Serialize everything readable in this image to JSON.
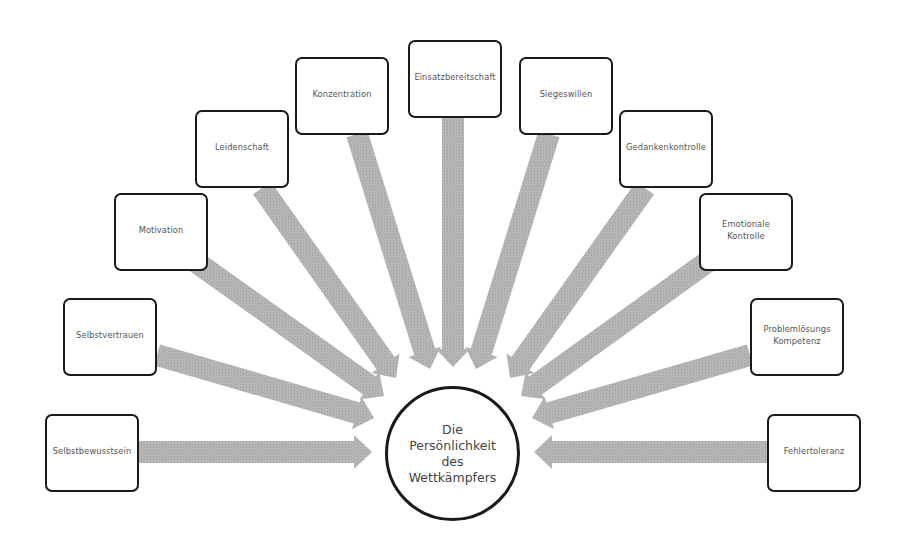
{
  "diagram": {
    "center": {
      "label": "Die\nPersönlichkeit\ndes\nWettkämpfers",
      "cx": 452,
      "cy": 453,
      "r": 67
    },
    "arrow_color": "#b3b3b3",
    "box_border_color": "#1a1a1a",
    "nodes": [
      {
        "id": "selbstbewusstsein",
        "label": "Selbstbewusstsein",
        "x": 45,
        "y": 414,
        "start": [
          138,
          452
        ],
        "end": [
          372,
          452
        ]
      },
      {
        "id": "selbstvertrauen",
        "label": "Selbstvertrauen",
        "x": 63,
        "y": 298,
        "start": [
          157,
          355
        ],
        "end": [
          374,
          418
        ]
      },
      {
        "id": "motivation",
        "label": "Motivation",
        "x": 114,
        "y": 193,
        "start": [
          196,
          262
        ],
        "end": [
          384,
          396
        ]
      },
      {
        "id": "leidenschaft",
        "label": "Leidenschaft",
        "x": 195,
        "y": 110,
        "start": [
          262,
          188
        ],
        "end": [
          396,
          378
        ]
      },
      {
        "id": "konzentration",
        "label": "Konzentration",
        "x": 295,
        "y": 57,
        "start": [
          357,
          134
        ],
        "end": [
          430,
          369
        ]
      },
      {
        "id": "einsatzbereitschaft",
        "label": "Einsatzbereitschaft",
        "x": 408,
        "y": 40,
        "start": [
          453,
          116
        ],
        "end": [
          453,
          367
        ]
      },
      {
        "id": "siegeswillen",
        "label": "Siegeswillen",
        "x": 519,
        "y": 57,
        "start": [
          549,
          134
        ],
        "end": [
          476,
          369
        ]
      },
      {
        "id": "gedankenkontrolle",
        "label": "Gedankenkontrolle",
        "x": 619,
        "y": 110,
        "start": [
          645,
          188
        ],
        "end": [
          510,
          378
        ]
      },
      {
        "id": "emotionale-kontrolle",
        "label": "Emotionale\nKontrolle",
        "x": 699,
        "y": 193,
        "start": [
          707,
          262
        ],
        "end": [
          521,
          396
        ]
      },
      {
        "id": "problemloesungs-kompetenz",
        "label": "Problemlösungs\nKompetenz",
        "x": 750,
        "y": 298,
        "start": [
          750,
          355
        ],
        "end": [
          532,
          418
        ]
      },
      {
        "id": "fehlertoleranz",
        "label": "Fehlertoleranz",
        "x": 767,
        "y": 414,
        "start": [
          767,
          452
        ],
        "end": [
          534,
          452
        ]
      }
    ]
  }
}
